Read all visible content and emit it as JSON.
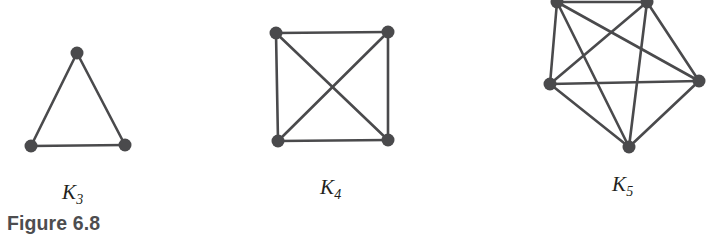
{
  "figure": {
    "caption": "Figure 6.8",
    "background_color": "#ffffff",
    "ink_color": "#4a4a4c",
    "text_color": "#231f20",
    "caption_color": "#4d4d4f",
    "width": 710,
    "height": 246
  },
  "chart_data": {
    "type": "diagram",
    "subtype": "graph-theory-node-link",
    "title": "Figure 6.8",
    "node_radius": 6.5,
    "edge_width": 2.6,
    "edge_color": "#4a4a4c",
    "node_color": "#4a4a4c",
    "graphs": [
      {
        "id": "k3",
        "label_letter": "K",
        "label_subscript": "3",
        "label_text": "K3",
        "vertex_count": 3,
        "edge_count": 3,
        "label_position": {
          "x": 62,
          "y": 182
        },
        "nodes": [
          {
            "id": "a",
            "x": 77,
            "y": 53
          },
          {
            "id": "b",
            "x": 31,
            "y": 146
          },
          {
            "id": "c",
            "x": 125,
            "y": 145
          }
        ],
        "edges": [
          [
            "a",
            "b"
          ],
          [
            "a",
            "c"
          ],
          [
            "b",
            "c"
          ]
        ]
      },
      {
        "id": "k4",
        "label_letter": "K",
        "label_subscript": "4",
        "label_text": "K4",
        "vertex_count": 4,
        "edge_count": 6,
        "label_position": {
          "x": 320,
          "y": 177
        },
        "nodes": [
          {
            "id": "a",
            "x": 276,
            "y": 33
          },
          {
            "id": "b",
            "x": 388,
            "y": 32
          },
          {
            "id": "c",
            "x": 278,
            "y": 141
          },
          {
            "id": "d",
            "x": 388,
            "y": 140
          }
        ],
        "edges": [
          [
            "a",
            "b"
          ],
          [
            "a",
            "c"
          ],
          [
            "a",
            "d"
          ],
          [
            "b",
            "c"
          ],
          [
            "b",
            "d"
          ],
          [
            "c",
            "d"
          ]
        ]
      },
      {
        "id": "k5",
        "label_letter": "K",
        "label_subscript": "5",
        "label_text": "K5",
        "vertex_count": 5,
        "edge_count": 10,
        "label_position": {
          "x": 612,
          "y": 174
        },
        "nodes": [
          {
            "id": "a",
            "x": 557,
            "y": 2
          },
          {
            "id": "b",
            "x": 647,
            "y": 2
          },
          {
            "id": "c",
            "x": 550,
            "y": 84
          },
          {
            "id": "d",
            "x": 699,
            "y": 81
          },
          {
            "id": "e",
            "x": 629,
            "y": 147
          }
        ],
        "edges": [
          [
            "a",
            "b"
          ],
          [
            "a",
            "c"
          ],
          [
            "a",
            "d"
          ],
          [
            "a",
            "e"
          ],
          [
            "b",
            "c"
          ],
          [
            "b",
            "d"
          ],
          [
            "b",
            "e"
          ],
          [
            "c",
            "d"
          ],
          [
            "c",
            "e"
          ],
          [
            "d",
            "e"
          ]
        ]
      }
    ]
  }
}
